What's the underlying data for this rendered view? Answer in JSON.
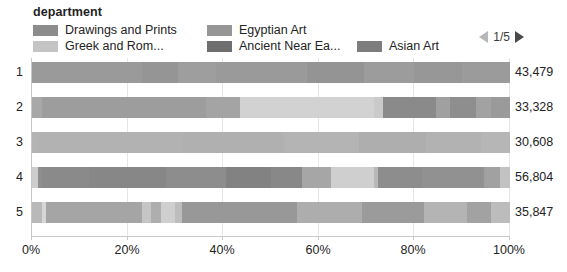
{
  "legend": {
    "title": "department",
    "items": [
      {
        "label": "Drawings and Prints",
        "color": "#8c8c8c",
        "row": 0,
        "col": 0
      },
      {
        "label": "Egyptian Art",
        "color": "#969696",
        "row": 0,
        "col": 1
      },
      {
        "label": "Greek and Rom...",
        "color": "#c4c4c4",
        "row": 1,
        "col": 0
      },
      {
        "label": "Ancient Near Ea...",
        "color": "#6f6f6f",
        "row": 1,
        "col": 1
      },
      {
        "label": "Asian Art",
        "color": "#7d7d7d",
        "row": 1,
        "col": 2
      }
    ]
  },
  "pager": {
    "text": "1/5",
    "prev_icon": "triangle-left-icon",
    "next_icon": "triangle-right-icon"
  },
  "axis": {
    "ticks": [
      "0%",
      "20%",
      "40%",
      "60%",
      "80%",
      "100%"
    ],
    "tick_positions": [
      0,
      20,
      40,
      60,
      80,
      100
    ]
  },
  "chart_data": {
    "type": "bar",
    "orientation": "horizontal",
    "stacked": true,
    "normalized": true,
    "title": "department",
    "xlabel": "",
    "ylabel": "",
    "xlim": [
      0,
      100
    ],
    "grid": true,
    "legend_position": "top",
    "categories": [
      "1",
      "2",
      "3",
      "4",
      "5"
    ],
    "totals": [
      "43,479",
      "33,328",
      "30,608",
      "56,804",
      "35,847"
    ],
    "series": [
      {
        "name": "Drawings and Prints",
        "color": "#8c8c8c"
      },
      {
        "name": "Egyptian Art",
        "color": "#969696"
      },
      {
        "name": "Greek and Rom...",
        "color": "#c4c4c4"
      },
      {
        "name": "Ancient Near Ea...",
        "color": "#6f6f6f"
      },
      {
        "name": "Asian Art",
        "color": "#7d7d7d"
      }
    ],
    "rows": [
      {
        "category": "1",
        "total": "43,479",
        "segments": [
          {
            "pct": 23.0,
            "color": "#9a9a9a"
          },
          {
            "pct": 7.5,
            "color": "#959595"
          },
          {
            "pct": 8.0,
            "color": "#9e9e9e"
          },
          {
            "pct": 19.0,
            "color": "#9a9a9a"
          },
          {
            "pct": 12.0,
            "color": "#949494"
          },
          {
            "pct": 10.5,
            "color": "#9c9c9c"
          },
          {
            "pct": 10.0,
            "color": "#979797"
          },
          {
            "pct": 10.0,
            "color": "#9b9b9b"
          }
        ]
      },
      {
        "category": "2",
        "total": "33,328",
        "segments": [
          {
            "pct": 2.0,
            "color": "#a8a8a8"
          },
          {
            "pct": 34.5,
            "color": "#9d9d9d"
          },
          {
            "pct": 7.0,
            "color": "#a4a4a4"
          },
          {
            "pct": 28.0,
            "color": "#d2d2d2"
          },
          {
            "pct": 2.0,
            "color": "#cacaca"
          },
          {
            "pct": 11.0,
            "color": "#8a8a8a"
          },
          {
            "pct": 3.0,
            "color": "#a0a0a0"
          },
          {
            "pct": 5.5,
            "color": "#8e8e8e"
          },
          {
            "pct": 3.0,
            "color": "#a2a2a2"
          },
          {
            "pct": 4.0,
            "color": "#9a9a9a"
          }
        ]
      },
      {
        "category": "3",
        "total": "30,608",
        "segments": [
          {
            "pct": 1.5,
            "color": "#b4b4b4"
          },
          {
            "pct": 30.0,
            "color": "#b2b2b2"
          },
          {
            "pct": 21.0,
            "color": "#b0b0b0"
          },
          {
            "pct": 16.0,
            "color": "#b4b4b4"
          },
          {
            "pct": 14.0,
            "color": "#aeaeae"
          },
          {
            "pct": 11.5,
            "color": "#b2b2b2"
          },
          {
            "pct": 6.0,
            "color": "#b6b6b6"
          }
        ]
      },
      {
        "category": "4",
        "total": "56,804",
        "segments": [
          {
            "pct": 1.2,
            "color": "#cdcdcd"
          },
          {
            "pct": 0.8,
            "color": "#8f8f8f"
          },
          {
            "pct": 10.0,
            "color": "#8a8a8a"
          },
          {
            "pct": 16.0,
            "color": "#878787"
          },
          {
            "pct": 12.5,
            "color": "#8d8d8d"
          },
          {
            "pct": 9.5,
            "color": "#828282"
          },
          {
            "pct": 6.5,
            "color": "#888888"
          },
          {
            "pct": 6.0,
            "color": "#a6a6a6"
          },
          {
            "pct": 9.0,
            "color": "#cfcfcf"
          },
          {
            "pct": 1.0,
            "color": "#b8b8b8"
          },
          {
            "pct": 9.0,
            "color": "#8d8d8d"
          },
          {
            "pct": 13.0,
            "color": "#919191"
          },
          {
            "pct": 3.5,
            "color": "#a1a1a1"
          },
          {
            "pct": 2.0,
            "color": "#c2c2c2"
          }
        ]
      },
      {
        "category": "5",
        "total": "35,847",
        "segments": [
          {
            "pct": 2.0,
            "color": "#b9b9b9"
          },
          {
            "pct": 1.0,
            "color": "#d6d6d6"
          },
          {
            "pct": 20.0,
            "color": "#a5a5a5"
          },
          {
            "pct": 2.0,
            "color": "#c6c6c6"
          },
          {
            "pct": 2.0,
            "color": "#aeaeae"
          },
          {
            "pct": 3.0,
            "color": "#cfcfcf"
          },
          {
            "pct": 1.5,
            "color": "#bdbdbd"
          },
          {
            "pct": 24.0,
            "color": "#989898"
          },
          {
            "pct": 13.5,
            "color": "#adadad"
          },
          {
            "pct": 13.0,
            "color": "#9b9b9b"
          },
          {
            "pct": 9.0,
            "color": "#b4b4b4"
          },
          {
            "pct": 5.0,
            "color": "#a2a2a2"
          },
          {
            "pct": 4.0,
            "color": "#bcbcbc"
          }
        ]
      }
    ]
  }
}
